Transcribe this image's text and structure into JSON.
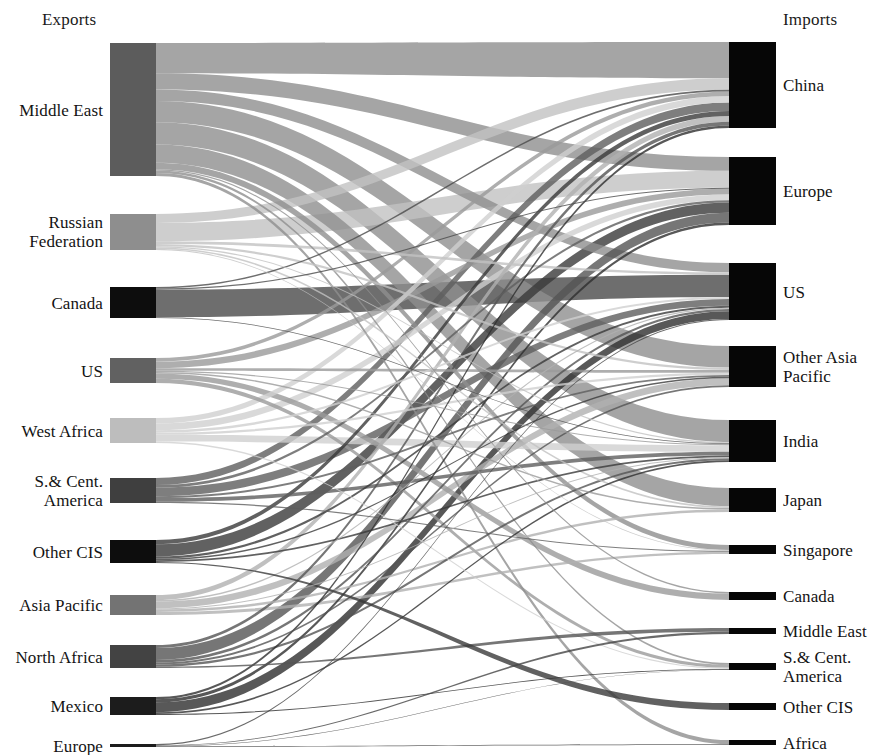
{
  "figure": {
    "type": "sankey",
    "title_left": "Exports",
    "title_right": "Imports",
    "background": "#ffffff",
    "geometry": {
      "width": 882,
      "height": 755,
      "left_node_x": 110,
      "left_node_w": 46,
      "right_node_x": 729,
      "right_node_w": 47,
      "left_label_right_edge": 103,
      "right_label_left_edge": 783
    }
  },
  "chart_data": {
    "type": "sankey",
    "xlabel": "",
    "ylabel": "",
    "units": "million tonnes per year",
    "legend": "none",
    "grid": false,
    "sources": [
      {
        "id": "me",
        "label": "Middle East",
        "value": 1110,
        "y0": 43,
        "y1": 176,
        "color": "#5c5c5c"
      },
      {
        "id": "rf",
        "label": "Russian\nFederation",
        "value": 300,
        "y0": 214,
        "y1": 250,
        "color": "#8e8e8e"
      },
      {
        "id": "ca",
        "label": "Canada",
        "value": 260,
        "y0": 287,
        "y1": 318,
        "color": "#0d0d0d"
      },
      {
        "id": "us",
        "label": "US",
        "value": 210,
        "y0": 358,
        "y1": 383,
        "color": "#616161"
      },
      {
        "id": "wa",
        "label": "West Africa",
        "value": 205,
        "y0": 418,
        "y1": 443,
        "color": "#bdbdbd"
      },
      {
        "id": "sca",
        "label": "S.& Cent.\nAmerica",
        "value": 205,
        "y0": 478,
        "y1": 503,
        "color": "#3f3f3f"
      },
      {
        "id": "ocis",
        "label": "Other CIS",
        "value": 190,
        "y0": 540,
        "y1": 563,
        "color": "#0d0d0d"
      },
      {
        "id": "ap",
        "label": "Asia Pacific",
        "value": 165,
        "y0": 595,
        "y1": 615,
        "color": "#737373"
      },
      {
        "id": "na",
        "label": "North Africa",
        "value": 190,
        "y0": 645,
        "y1": 668,
        "color": "#434343"
      },
      {
        "id": "mx",
        "label": "Mexico",
        "value": 150,
        "y0": 697,
        "y1": 715,
        "color": "#1c1c1c"
      },
      {
        "id": "eu",
        "label": "Europe",
        "value": 25,
        "y0": 744,
        "y1": 747,
        "color": "#1c1c1c"
      }
    ],
    "targets": [
      {
        "id": "tcn",
        "label": "China",
        "value": 715,
        "y0": 42,
        "y1": 128,
        "color": "#060606"
      },
      {
        "id": "teu",
        "label": "Europe",
        "value": 565,
        "y0": 157,
        "y1": 225,
        "color": "#060606"
      },
      {
        "id": "tus",
        "label": "US",
        "value": 475,
        "y0": 263,
        "y1": 320,
        "color": "#060606"
      },
      {
        "id": "toap",
        "label": "Other Asia\nPacific",
        "value": 340,
        "y0": 346,
        "y1": 387,
        "color": "#060606"
      },
      {
        "id": "tin",
        "label": "India",
        "value": 350,
        "y0": 420,
        "y1": 462,
        "color": "#060606"
      },
      {
        "id": "tjp",
        "label": "Japan",
        "value": 200,
        "y0": 488,
        "y1": 512,
        "color": "#060606"
      },
      {
        "id": "tsg",
        "label": "Singapore",
        "value": 75,
        "y0": 545,
        "y1": 554,
        "color": "#060606"
      },
      {
        "id": "tca",
        "label": "Canada",
        "value": 70,
        "y0": 592,
        "y1": 600,
        "color": "#060606"
      },
      {
        "id": "tme",
        "label": "Middle East",
        "value": 52,
        "y0": 628,
        "y1": 634,
        "color": "#060606"
      },
      {
        "id": "tsca",
        "label": "S.& Cent.\nAmerica",
        "value": 58,
        "y0": 663,
        "y1": 670,
        "color": "#060606"
      },
      {
        "id": "tocis",
        "label": "Other CIS",
        "value": 58,
        "y0": 703,
        "y1": 710,
        "color": "#060606"
      },
      {
        "id": "taf",
        "label": "Africa",
        "value": 45,
        "y0": 740,
        "y1": 745,
        "color": "#060606"
      }
    ],
    "links": [
      {
        "source": "me",
        "target": "tcn",
        "value": 250,
        "color": "#8f8f8f"
      },
      {
        "source": "me",
        "target": "tin",
        "value": 185,
        "color": "#8f8f8f"
      },
      {
        "source": "me",
        "target": "tjp",
        "value": 150,
        "color": "#8f8f8f"
      },
      {
        "source": "me",
        "target": "toap",
        "value": 175,
        "color": "#8f8f8f"
      },
      {
        "source": "me",
        "target": "teu",
        "value": 135,
        "color": "#8f8f8f"
      },
      {
        "source": "me",
        "target": "tus",
        "value": 95,
        "color": "#8f8f8f"
      },
      {
        "source": "me",
        "target": "tsg",
        "value": 55,
        "color": "#8f8f8f"
      },
      {
        "source": "me",
        "target": "tsca",
        "value": 20,
        "color": "#8f8f8f"
      },
      {
        "source": "me",
        "target": "taf",
        "value": 25,
        "color": "#8f8f8f"
      },
      {
        "source": "me",
        "target": "tca",
        "value": 10,
        "color": "#8f8f8f"
      },
      {
        "source": "rf",
        "target": "teu",
        "value": 165,
        "color": "#c2c2c2"
      },
      {
        "source": "rf",
        "target": "tcn",
        "value": 80,
        "color": "#c2c2c2"
      },
      {
        "source": "rf",
        "target": "tus",
        "value": 25,
        "color": "#c2c2c2"
      },
      {
        "source": "rf",
        "target": "toap",
        "value": 20,
        "color": "#c2c2c2"
      },
      {
        "source": "rf",
        "target": "tin",
        "value": 10,
        "color": "#c2c2c2"
      },
      {
        "source": "rf",
        "target": "tjp",
        "value": 15,
        "color": "#c2c2c2"
      },
      {
        "source": "rf",
        "target": "tsg",
        "value": 8,
        "color": "#c2c2c2"
      },
      {
        "source": "ca",
        "target": "tus",
        "value": 225,
        "color": "#4a4a4a"
      },
      {
        "source": "ca",
        "target": "tcn",
        "value": 12,
        "color": "#4a4a4a"
      },
      {
        "source": "ca",
        "target": "teu",
        "value": 10,
        "color": "#4a4a4a"
      },
      {
        "source": "ca",
        "target": "tin",
        "value": 6,
        "color": "#4a4a4a"
      },
      {
        "source": "us",
        "target": "teu",
        "value": 55,
        "color": "#9a9a9a"
      },
      {
        "source": "us",
        "target": "tca",
        "value": 45,
        "color": "#9a9a9a"
      },
      {
        "source": "us",
        "target": "tsca",
        "value": 35,
        "color": "#9a9a9a"
      },
      {
        "source": "us",
        "target": "tcn",
        "value": 30,
        "color": "#9a9a9a"
      },
      {
        "source": "us",
        "target": "toap",
        "value": 22,
        "color": "#9a9a9a"
      },
      {
        "source": "us",
        "target": "tjp",
        "value": 12,
        "color": "#9a9a9a"
      },
      {
        "source": "us",
        "target": "tin",
        "value": 10,
        "color": "#9a9a9a"
      },
      {
        "source": "wa",
        "target": "tin",
        "value": 55,
        "color": "#cfcfcf"
      },
      {
        "source": "wa",
        "target": "teu",
        "value": 55,
        "color": "#cfcfcf"
      },
      {
        "source": "wa",
        "target": "tcn",
        "value": 45,
        "color": "#cfcfcf"
      },
      {
        "source": "wa",
        "target": "tus",
        "value": 20,
        "color": "#cfcfcf"
      },
      {
        "source": "wa",
        "target": "toap",
        "value": 18,
        "color": "#cfcfcf"
      },
      {
        "source": "wa",
        "target": "tsca",
        "value": 12,
        "color": "#cfcfcf"
      },
      {
        "source": "sca",
        "target": "tus",
        "value": 70,
        "color": "#5e5e5e"
      },
      {
        "source": "sca",
        "target": "tcn",
        "value": 58,
        "color": "#5e5e5e"
      },
      {
        "source": "sca",
        "target": "tin",
        "value": 30,
        "color": "#5e5e5e"
      },
      {
        "source": "sca",
        "target": "teu",
        "value": 22,
        "color": "#5e5e5e"
      },
      {
        "source": "sca",
        "target": "toap",
        "value": 15,
        "color": "#5e5e5e"
      },
      {
        "source": "sca",
        "target": "tsg",
        "value": 10,
        "color": "#5e5e5e"
      },
      {
        "source": "ocis",
        "target": "teu",
        "value": 100,
        "color": "#3a3a3a"
      },
      {
        "source": "ocis",
        "target": "tcn",
        "value": 35,
        "color": "#3a3a3a"
      },
      {
        "source": "ocis",
        "target": "tus",
        "value": 20,
        "color": "#3a3a3a"
      },
      {
        "source": "ocis",
        "target": "tin",
        "value": 15,
        "color": "#3a3a3a"
      },
      {
        "source": "ocis",
        "target": "toap",
        "value": 12,
        "color": "#3a3a3a"
      },
      {
        "source": "ocis",
        "target": "tocis",
        "value": 8,
        "color": "#3a3a3a"
      },
      {
        "source": "ap",
        "target": "toap",
        "value": 55,
        "color": "#b0b0b0"
      },
      {
        "source": "ap",
        "target": "tcn",
        "value": 40,
        "color": "#b0b0b0"
      },
      {
        "source": "ap",
        "target": "tsg",
        "value": 25,
        "color": "#b0b0b0"
      },
      {
        "source": "ap",
        "target": "tjp",
        "value": 20,
        "color": "#b0b0b0"
      },
      {
        "source": "ap",
        "target": "tus",
        "value": 12,
        "color": "#b0b0b0"
      },
      {
        "source": "ap",
        "target": "tin",
        "value": 8,
        "color": "#b0b0b0"
      },
      {
        "source": "na",
        "target": "teu",
        "value": 95,
        "color": "#545454"
      },
      {
        "source": "na",
        "target": "tcn",
        "value": 25,
        "color": "#545454"
      },
      {
        "source": "na",
        "target": "tus",
        "value": 22,
        "color": "#545454"
      },
      {
        "source": "na",
        "target": "tin",
        "value": 18,
        "color": "#545454"
      },
      {
        "source": "na",
        "target": "toap",
        "value": 15,
        "color": "#545454"
      },
      {
        "source": "na",
        "target": "tme",
        "value": 10,
        "color": "#545454"
      },
      {
        "source": "mx",
        "target": "tus",
        "value": 80,
        "color": "#2e2e2e"
      },
      {
        "source": "mx",
        "target": "teu",
        "value": 25,
        "color": "#2e2e2e"
      },
      {
        "source": "mx",
        "target": "tcn",
        "value": 18,
        "color": "#2e2e2e"
      },
      {
        "source": "mx",
        "target": "tin",
        "value": 14,
        "color": "#2e2e2e"
      },
      {
        "source": "mx",
        "target": "tsca",
        "value": 8,
        "color": "#2e2e2e"
      },
      {
        "source": "eu",
        "target": "tus",
        "value": 10,
        "color": "#454545"
      },
      {
        "source": "eu",
        "target": "tme",
        "value": 6,
        "color": "#454545"
      },
      {
        "source": "eu",
        "target": "taf",
        "value": 5,
        "color": "#454545"
      },
      {
        "source": "eu",
        "target": "tsca",
        "value": 4,
        "color": "#454545"
      }
    ]
  }
}
